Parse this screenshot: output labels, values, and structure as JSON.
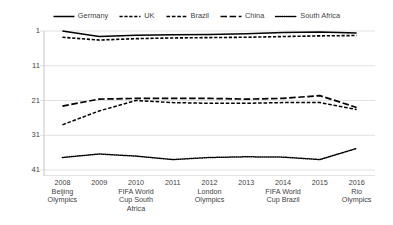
{
  "legend": {
    "position": "top-center",
    "entries": [
      {
        "label": "Germany",
        "style": "solid",
        "icon": "line-solid-icon"
      },
      {
        "label": "UK",
        "style": "dashed",
        "icon": "line-dashed-icon"
      },
      {
        "label": "Brazil",
        "style": "dash-dot",
        "icon": "line-dash-dot-icon"
      },
      {
        "label": "China",
        "style": "long-dash",
        "icon": "line-long-dash-icon"
      },
      {
        "label": "South Africa",
        "style": "dotted",
        "icon": "line-dotted-icon"
      }
    ]
  },
  "axes": {
    "y_ticks": [
      "1",
      "11",
      "21",
      "31",
      "41"
    ],
    "x_ticks": [
      {
        "year": "2008",
        "event": "Beijing Olympics"
      },
      {
        "year": "2009",
        "event": ""
      },
      {
        "year": "2010",
        "event": "FIFA World Cup South Africa"
      },
      {
        "year": "2011",
        "event": ""
      },
      {
        "year": "2012",
        "event": "London Olympics"
      },
      {
        "year": "2013",
        "event": ""
      },
      {
        "year": "2014",
        "event": "FIFA World Cup Brazil"
      },
      {
        "year": "2015",
        "event": ""
      },
      {
        "year": "2016",
        "event": "Rio Olympics"
      }
    ]
  },
  "colors": {
    "line": "#000000",
    "grid": "#d9d9d9",
    "axis": "#bfbfbf",
    "text": "#3f3f3f",
    "background": "#ffffff"
  },
  "chart_data": {
    "type": "line",
    "title": "",
    "xlabel": "",
    "ylabel": "",
    "ylim": [
      1,
      41
    ],
    "y_inverted": true,
    "grid": true,
    "legend_position": "top-center",
    "categories": [
      "2008",
      "2009",
      "2010",
      "2011",
      "2012",
      "2013",
      "2014",
      "2015",
      "2016"
    ],
    "category_events": [
      "Beijing Olympics",
      "",
      "FIFA World Cup South Africa",
      "",
      "London Olympics",
      "",
      "FIFA World Cup Brazil",
      "",
      "Rio Olympics"
    ],
    "series": [
      {
        "name": "Germany",
        "style": "solid",
        "values": [
          1.0,
          2.6,
          2.2,
          2.1,
          2.0,
          1.8,
          1.4,
          1.3,
          1.6
        ]
      },
      {
        "name": "UK",
        "style": "dashed",
        "values": [
          2.8,
          3.6,
          3.2,
          3.0,
          2.9,
          2.8,
          2.6,
          2.4,
          2.3
        ]
      },
      {
        "name": "Brazil",
        "style": "dash-dot",
        "values": [
          28.0,
          24.0,
          21.0,
          21.6,
          21.8,
          21.8,
          21.6,
          21.6,
          23.6
        ]
      },
      {
        "name": "China",
        "style": "long-dash",
        "values": [
          22.6,
          20.6,
          20.4,
          20.4,
          20.4,
          20.6,
          20.4,
          19.6,
          23.0
        ]
      },
      {
        "name": "South Africa",
        "style": "dotted",
        "values": [
          37.4,
          36.4,
          37.0,
          38.0,
          37.4,
          37.2,
          37.3,
          38.0,
          34.8
        ]
      }
    ]
  }
}
